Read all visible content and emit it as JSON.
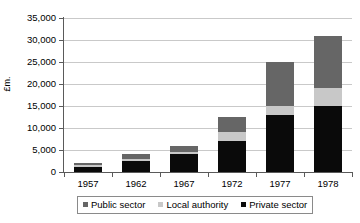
{
  "chart_data": {
    "type": "bar",
    "stacked": true,
    "title": "",
    "xlabel": "",
    "ylabel": "£m.",
    "categories": [
      "1957",
      "1962",
      "1967",
      "1972",
      "1977",
      "1978"
    ],
    "series": [
      {
        "name": "Private sector",
        "color": "#0a0a0a",
        "values": [
          1200,
          2500,
          4000,
          7000,
          13000,
          15000
        ]
      },
      {
        "name": "Local authority",
        "color": "#c8c8c8",
        "values": [
          300,
          500,
          500,
          2000,
          2000,
          4000
        ]
      },
      {
        "name": "Public sector",
        "color": "#666666",
        "values": [
          500,
          1000,
          1500,
          3500,
          10000,
          12000
        ]
      }
    ],
    "totals": [
      2000,
      4000,
      6000,
      12500,
      25000,
      31000
    ],
    "ylim": [
      0,
      35000
    ],
    "yticks": [
      0,
      5000,
      10000,
      15000,
      20000,
      25000,
      30000,
      35000
    ],
    "ytick_labels": [
      "0",
      "5,000",
      "10,000",
      "15,000",
      "20,000",
      "25,000",
      "30,000",
      "35,000"
    ],
    "grid": true,
    "legend_position": "bottom",
    "legend_entries": [
      {
        "label": "Public sector",
        "color": "#666666"
      },
      {
        "label": "Local authority",
        "color": "#c8c8c8"
      },
      {
        "label": "Private sector",
        "color": "#0a0a0a"
      }
    ]
  }
}
